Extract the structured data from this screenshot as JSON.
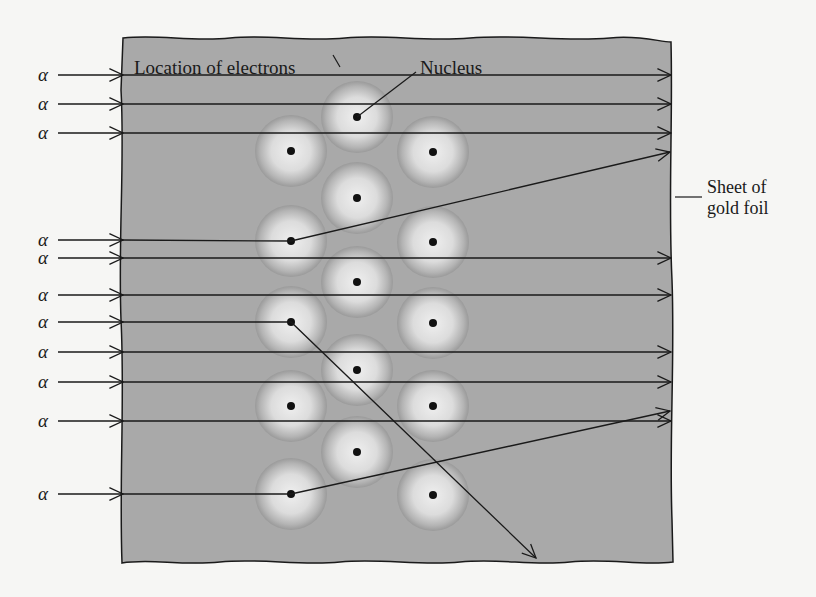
{
  "figure": {
    "labels": {
      "electrons": "Location of electrons",
      "nucleus": "Nucleus",
      "foil_line1": "Sheet of",
      "foil_line2": "gold foil"
    },
    "alpha_symbol": "α",
    "colors": {
      "background": "#f6f6f4",
      "foil": "#a9a9a9",
      "atom_center": "#ececec",
      "atom_edge": "#9c9c9c",
      "line": "#1a1a1a"
    },
    "foil_bounds": {
      "x1": 122,
      "y1": 37,
      "x2": 673,
      "y2": 563
    },
    "atoms": [
      {
        "cx": 357,
        "cy": 117
      },
      {
        "cx": 291,
        "cy": 151
      },
      {
        "cx": 433,
        "cy": 152
      },
      {
        "cx": 357,
        "cy": 198
      },
      {
        "cx": 291,
        "cy": 241
      },
      {
        "cx": 433,
        "cy": 242
      },
      {
        "cx": 357,
        "cy": 282
      },
      {
        "cx": 291,
        "cy": 322
      },
      {
        "cx": 433,
        "cy": 323
      },
      {
        "cx": 357,
        "cy": 370
      },
      {
        "cx": 291,
        "cy": 406
      },
      {
        "cx": 433,
        "cy": 406
      },
      {
        "cx": 357,
        "cy": 452
      },
      {
        "cx": 291,
        "cy": 494
      },
      {
        "cx": 433,
        "cy": 495
      }
    ],
    "alpha_rays": [
      {
        "y": 75,
        "type": "straight"
      },
      {
        "y": 104,
        "type": "straight"
      },
      {
        "y": 133,
        "type": "straight"
      },
      {
        "y": 240,
        "type": "deflected",
        "pivot": [
          291,
          241
        ],
        "end": [
          670,
          152
        ]
      },
      {
        "y": 258,
        "type": "straight"
      },
      {
        "y": 295,
        "type": "straight"
      },
      {
        "y": 322,
        "type": "deflected",
        "pivot": [
          291,
          322
        ],
        "end": [
          536,
          558
        ]
      },
      {
        "y": 352,
        "type": "straight"
      },
      {
        "y": 382,
        "type": "straight"
      },
      {
        "y": 421,
        "type": "straight"
      },
      {
        "y": 494,
        "type": "deflected",
        "pivot": [
          291,
          494
        ],
        "end": [
          670,
          411
        ]
      }
    ]
  }
}
